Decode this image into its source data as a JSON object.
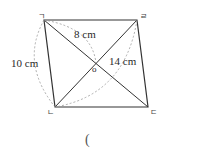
{
  "figure": {
    "shape": "parallelogram",
    "vertices": {
      "top_left": "ㄱ",
      "top_right": "ㄹ",
      "bottom_left": "ㄴ",
      "bottom_right": "ㄷ"
    },
    "center_label": "o",
    "measurements": {
      "side_left": "10 cm",
      "half_diagonal_top": "8 cm",
      "diagonal_right": "14 cm"
    }
  },
  "answer_blank": "("
}
